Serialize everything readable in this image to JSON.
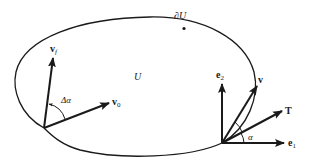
{
  "diagram": {
    "region": {
      "label": "U",
      "boundary_label": "∂U",
      "boundary_color": "#1a1a1a"
    },
    "left_vectors": {
      "v_final": {
        "label": "v",
        "subscript": "f"
      },
      "v_initial": {
        "label": "v",
        "subscript": "0"
      },
      "angle_label": "Δα"
    },
    "right_frame": {
      "e2": {
        "label": "e",
        "subscript": "2"
      },
      "e1": {
        "label": "e",
        "subscript": "1"
      },
      "v": {
        "label": "v"
      },
      "T": {
        "label": "T"
      },
      "angle_label": "α"
    },
    "ink_color": "#1a1a1a"
  }
}
